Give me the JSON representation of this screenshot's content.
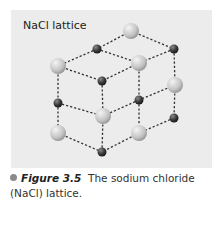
{
  "figure": {
    "title": "NaCl lattice",
    "caption_label": "Figure 3.5",
    "caption_text": "The sodium chloride (NaCl) lattice."
  },
  "colors": {
    "panel": "#ececec",
    "large_ion": "#c8c8c8",
    "small_ion": "#3a3a3a",
    "bond": "#333333"
  },
  "lattice": {
    "large_ions": [
      [
        131,
        31
      ],
      [
        58,
        66
      ],
      [
        139,
        63
      ],
      [
        175,
        85
      ],
      [
        103,
        116
      ],
      [
        58,
        133
      ],
      [
        139,
        133
      ]
    ],
    "small_ions": [
      [
        97,
        49
      ],
      [
        174,
        49
      ],
      [
        102,
        81
      ],
      [
        58,
        103
      ],
      [
        139,
        100
      ],
      [
        174,
        118
      ],
      [
        102,
        152
      ]
    ]
  }
}
